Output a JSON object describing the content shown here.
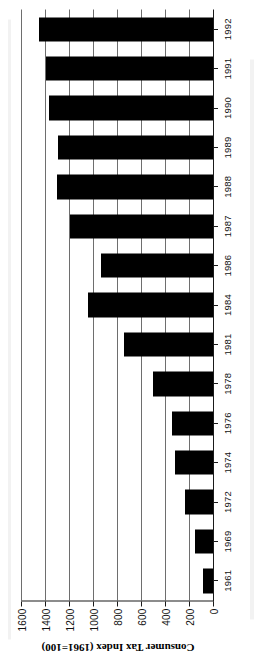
{
  "chart_data": {
    "type": "bar",
    "orientation": "vertical-rendered-rotated",
    "title": "",
    "xlabel": "",
    "ylabel": "Consumer Tax Index (1961=100)",
    "ylim": [
      0,
      1600
    ],
    "ytick_step": 200,
    "grid": true,
    "legend": false,
    "bar_color": "#000000",
    "categories": [
      "1961",
      "1969",
      "1972",
      "1974",
      "1976",
      "1978",
      "1981",
      "1984",
      "1986",
      "1987",
      "1988",
      "1989",
      "1990",
      "1991",
      "1992"
    ],
    "values": [
      80,
      150,
      230,
      320,
      340,
      500,
      740,
      1040,
      930,
      1190,
      1300,
      1290,
      1370,
      1390,
      1450
    ],
    "ytick_labels": [
      "0",
      "200",
      "400",
      "600",
      "800",
      "1000",
      "1200",
      "1400",
      "1600"
    ],
    "ytick_values": [
      0,
      200,
      400,
      600,
      800,
      1000,
      1200,
      1400,
      1600
    ]
  },
  "figure": {
    "axis_title": "Consumer Tax Index (1961=100)",
    "page_orientation": "rotated-90"
  }
}
